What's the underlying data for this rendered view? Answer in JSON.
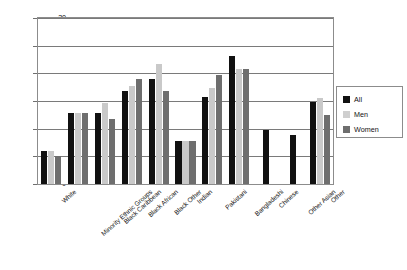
{
  "chart_data": {
    "type": "bar",
    "title": "",
    "subtitle": "",
    "xlabel": "",
    "ylabel": "",
    "ylim": [
      0,
      30
    ],
    "yticks": [
      0,
      5,
      10,
      15,
      20,
      25,
      30
    ],
    "grid": true,
    "legend_position": "right",
    "categories": [
      "White",
      "Minority Ethnic Groups",
      "Black Caribbean",
      "Black African",
      "Black Other",
      "Indian",
      "Pakistani",
      "Bangladeshi",
      "Chinese",
      "Other Asian",
      "Other"
    ],
    "series": [
      {
        "name": "All",
        "color": "#111111",
        "values": [
          6,
          12.8,
          12.8,
          16.8,
          19,
          7.8,
          15.7,
          23.2,
          9.8,
          8.8,
          14.8
        ]
      },
      {
        "name": "Men",
        "color": "#c9c9c9",
        "values": [
          6,
          12.8,
          14.6,
          17.8,
          21.6,
          7.8,
          17.3,
          20.8,
          null,
          null,
          15.5
        ]
      },
      {
        "name": "Women",
        "color": "#6e6e6e",
        "values": [
          5,
          12.8,
          11.8,
          19,
          16.8,
          7.8,
          19.7,
          20.8,
          null,
          null,
          12.5
        ]
      }
    ]
  },
  "legend": {
    "items": [
      {
        "label": "All",
        "key": "all"
      },
      {
        "label": "Men",
        "key": "men"
      },
      {
        "label": "Women",
        "key": "women"
      }
    ]
  },
  "caption": ""
}
